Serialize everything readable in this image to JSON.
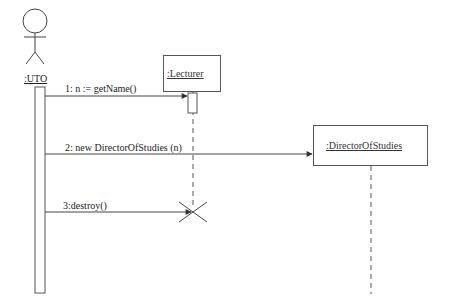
{
  "diagram": {
    "type": "UML sequence diagram",
    "participants": [
      {
        "id": "uto",
        "label": ":UTO",
        "kind": "actor"
      },
      {
        "id": "lecturer",
        "label": ":Lecturer",
        "kind": "object"
      },
      {
        "id": "dos",
        "label": ":DirectorOfStudies",
        "kind": "object",
        "created": true
      }
    ],
    "messages": [
      {
        "seq": 1,
        "label": "1: n := getName()",
        "from": "uto",
        "to": "lecturer"
      },
      {
        "seq": 2,
        "label": "2: new DirectorOfStudies (n)",
        "from": "uto",
        "to": "dos"
      },
      {
        "seq": 3,
        "label": "3:destroy()",
        "from": "uto",
        "to": "lecturer",
        "destroys": true
      }
    ],
    "colors": {
      "line": "#444444",
      "background": "#ffffff"
    }
  }
}
